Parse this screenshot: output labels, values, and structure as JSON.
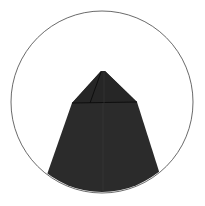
{
  "diagram": {
    "type": "origami-fold-detail",
    "circle": {
      "cx": 102,
      "cy": 102,
      "r": 91,
      "stroke": "#444444"
    },
    "shape": {
      "fill": "#2a2a2a",
      "crease_color": "#111111",
      "apex": [
        103,
        71
      ],
      "shoulder_left": [
        72,
        103
      ],
      "shoulder_right": [
        137,
        102
      ]
    },
    "background": "#ffffff"
  }
}
